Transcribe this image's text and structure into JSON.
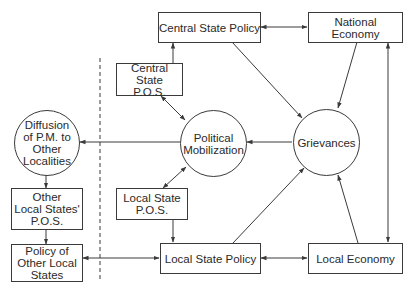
{
  "diagram": {
    "type": "flow-diagram",
    "nodes": {
      "central_state_policy": {
        "label": "Central State Policy",
        "shape": "box"
      },
      "national_economy": {
        "label": "National Economy",
        "shape": "box"
      },
      "central_state_pos": {
        "label": "Central State\nP.O.S.",
        "shape": "box"
      },
      "diffusion": {
        "label": "Diffusion\nof P.M. to\nOther\nLocalities",
        "shape": "circle"
      },
      "political_mobilization": {
        "label": "Political\nMobilization",
        "shape": "circle"
      },
      "grievances": {
        "label": "Grievances",
        "shape": "circle"
      },
      "other_local_states_pos": {
        "label": "Other\nLocal States'\nP.O.S.",
        "shape": "box"
      },
      "local_state_pos": {
        "label": "Local State\nP.O.S.",
        "shape": "box"
      },
      "policy_other_local_states": {
        "label": "Policy of\nOther Local\nStates",
        "shape": "box"
      },
      "local_state_policy": {
        "label": "Local State Policy",
        "shape": "box"
      },
      "local_economy": {
        "label": "Local Economy",
        "shape": "box"
      }
    },
    "edges": [
      {
        "from": "central_state_policy",
        "to": "national_economy",
        "bidirectional": true
      },
      {
        "from": "central_state_pos",
        "to": "central_state_policy",
        "bidirectional": false
      },
      {
        "from": "central_state_pos",
        "to": "political_mobilization",
        "bidirectional": true
      },
      {
        "from": "central_state_policy",
        "to": "grievances",
        "bidirectional": false
      },
      {
        "from": "national_economy",
        "to": "grievances",
        "bidirectional": false
      },
      {
        "from": "national_economy",
        "to": "local_economy",
        "bidirectional": true
      },
      {
        "from": "grievances",
        "to": "political_mobilization",
        "bidirectional": false
      },
      {
        "from": "political_mobilization",
        "to": "diffusion",
        "bidirectional": false
      },
      {
        "from": "diffusion",
        "to": "other_local_states_pos",
        "bidirectional": false
      },
      {
        "from": "other_local_states_pos",
        "to": "policy_other_local_states",
        "bidirectional": false
      },
      {
        "from": "political_mobilization",
        "to": "local_state_pos",
        "bidirectional": true
      },
      {
        "from": "local_state_pos",
        "to": "local_state_policy",
        "bidirectional": false
      },
      {
        "from": "policy_other_local_states",
        "to": "local_state_policy",
        "bidirectional": true
      },
      {
        "from": "local_state_policy",
        "to": "local_economy",
        "bidirectional": true
      },
      {
        "from": "local_state_policy",
        "to": "grievances",
        "bidirectional": false
      },
      {
        "from": "local_economy",
        "to": "grievances",
        "bidirectional": false
      }
    ],
    "separator": {
      "style": "dashed",
      "orientation": "vertical"
    },
    "colors": {
      "stroke": "#3a3a3a",
      "background": "#ffffff",
      "text": "#2a2a2a"
    }
  }
}
